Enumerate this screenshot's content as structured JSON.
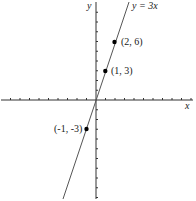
{
  "diagram": {
    "type": "coordinate-plane-line",
    "equation_label": "y = 3x",
    "x_axis_label": "x",
    "y_axis_label": "y",
    "points": [
      {
        "x": 2,
        "y": 6,
        "label": "(2, 6)"
      },
      {
        "x": 1,
        "y": 3,
        "label": "(1, 3)"
      },
      {
        "x": -1,
        "y": -3,
        "label": "(-1, -3)"
      }
    ],
    "colors": {
      "axis": "#333333",
      "line": "#555555",
      "point": "#000000",
      "text": "#1a1a1a"
    }
  },
  "chart_data": {
    "type": "line",
    "title": "",
    "xlabel": "x",
    "ylabel": "y",
    "series": [
      {
        "name": "y = 3x",
        "x": [
          -3.5,
          3.5
        ],
        "y": [
          -10.5,
          10.5
        ]
      }
    ],
    "points": [
      {
        "x": 2,
        "y": 6,
        "label": "(2, 6)"
      },
      {
        "x": 1,
        "y": 3,
        "label": "(1, 3)"
      },
      {
        "x": -1,
        "y": -3,
        "label": "(-1, -3)"
      }
    ],
    "xlim": [
      -10,
      10
    ],
    "ylim": [
      -10,
      10
    ],
    "grid": false,
    "legend": "none"
  }
}
